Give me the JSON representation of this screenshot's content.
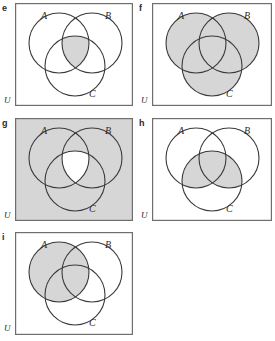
{
  "figure": {
    "colors": {
      "shade": "#d6d6d6",
      "stroke": "#3a3a3a",
      "frame": "#6e6e6e",
      "background": "#ffffff",
      "text": "#2b2b2b"
    }
  },
  "panels": [
    {
      "letter": "e",
      "universe_label": "U",
      "set_labels": {
        "a": "A",
        "b": "B",
        "c": "C"
      },
      "shaded_description": "triple intersection A and B and C",
      "shaded_regions": [
        "ABC"
      ],
      "universe_shaded": false
    },
    {
      "letter": "f",
      "universe_label": "U",
      "set_labels": {
        "a": "A",
        "b": "B",
        "c": "C"
      },
      "shaded_description": "union of A, B and C",
      "shaded_regions": [
        "A",
        "B",
        "C",
        "AB",
        "AC",
        "BC",
        "ABC"
      ],
      "universe_shaded": false
    },
    {
      "letter": "g",
      "universe_label": "U",
      "set_labels": {
        "a": "A",
        "b": "B",
        "c": "C"
      },
      "shaded_description": "complement of the triple intersection",
      "shaded_regions": [
        "U",
        "A",
        "B",
        "C",
        "AB",
        "AC",
        "BC"
      ],
      "universe_shaded": true
    },
    {
      "letter": "h",
      "universe_label": "U",
      "set_labels": {
        "a": "A",
        "b": "B",
        "c": "C"
      },
      "shaded_description": "C intersected with the union of A and B",
      "shaded_regions": [
        "AC",
        "BC",
        "ABC"
      ],
      "universe_shaded": false
    },
    {
      "letter": "i",
      "universe_label": "U",
      "set_labels": {
        "a": "A",
        "b": "B",
        "c": "C"
      },
      "shaded_description": "set A entirely",
      "shaded_regions": [
        "A",
        "AB",
        "AC",
        "ABC"
      ],
      "universe_shaded": false
    }
  ]
}
